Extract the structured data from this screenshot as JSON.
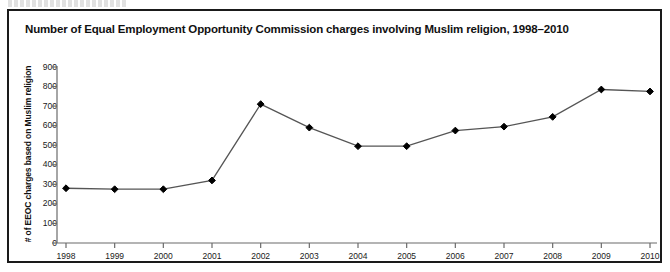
{
  "figure": {
    "title": "Number of Equal Employment Opportunity Commission charges involving Muslim religion, 1998–2010",
    "top_cut_caption": ""
  },
  "chart_data": {
    "type": "line",
    "title": "Number of Equal Employment Opportunity Commission charges involving Muslim religion, 1998–2010",
    "xlabel": "",
    "ylabel": "# of EEOC charges based on  Muslim religion",
    "categories": [
      "1998",
      "1999",
      "2000",
      "2001",
      "2002",
      "2003",
      "2004",
      "2005",
      "2006",
      "2007",
      "2008",
      "2009",
      "2010"
    ],
    "values": [
      280,
      275,
      275,
      320,
      710,
      590,
      495,
      495,
      575,
      595,
      645,
      785,
      775
    ],
    "ylim": [
      0,
      900
    ],
    "yticks": [
      0,
      100,
      200,
      300,
      400,
      500,
      600,
      700,
      800,
      900
    ],
    "ytick_labels": [
      "0",
      "100",
      "200",
      "300",
      "400",
      "500",
      "600",
      "700",
      "800",
      "900"
    ],
    "grid": false,
    "legend": null,
    "series": [
      {
        "name": "EEOC charges involving Muslim religion",
        "marker": "diamond",
        "marker_color": "#000000",
        "line_color": "#555555",
        "values": [
          280,
          275,
          275,
          320,
          710,
          590,
          495,
          495,
          575,
          595,
          645,
          785,
          775
        ]
      }
    ]
  },
  "colors": {
    "frame": "#1a1a1a",
    "axis": "#6b6b6b",
    "line": "#555555",
    "marker": "#000000",
    "text": "#111111",
    "background": "#ffffff"
  }
}
